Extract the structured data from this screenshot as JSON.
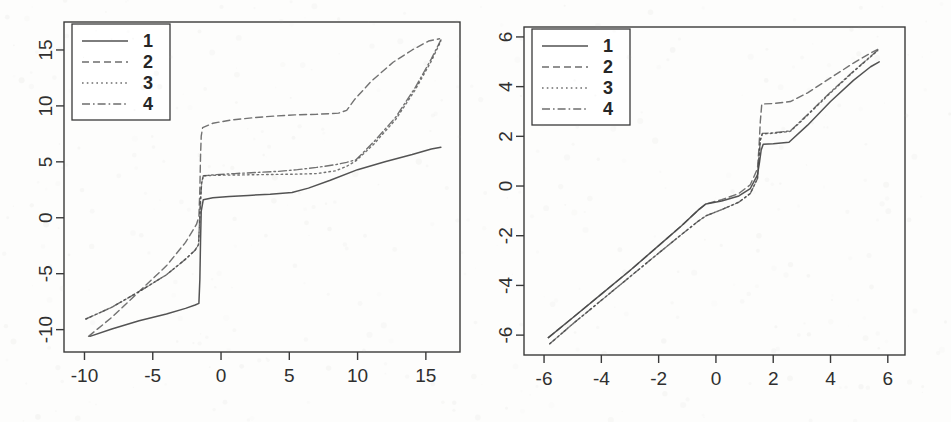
{
  "figure": {
    "title": "",
    "background_color": "#fdfdfc",
    "line_color": "#4a4a4a",
    "axis_color": "#3a3a3a",
    "panel_count": 2
  },
  "chart_data": [
    {
      "type": "line",
      "panel": "left",
      "title": "",
      "xlabel": "",
      "ylabel": "",
      "xlim": [
        -11.5,
        17.5
      ],
      "ylim": [
        -12.0,
        17.5
      ],
      "xticks": [
        -10,
        -5,
        0,
        5,
        10,
        15
      ],
      "yticks": [
        -10,
        -5,
        0,
        5,
        10,
        15
      ],
      "xtick_labels": [
        "-10",
        "-5",
        "0",
        "5",
        "10",
        "15"
      ],
      "ytick_labels": [
        "-10",
        "-5",
        "0",
        "5",
        "10",
        "15"
      ],
      "grid": false,
      "legend_position": "top-left",
      "legend_entries": [
        "1",
        "2",
        "3",
        "4"
      ],
      "series": [
        {
          "name": "1",
          "style": "solid",
          "x": [
            -9.6,
            -8.0,
            -6.0,
            -4.0,
            -2.6,
            -1.9,
            -1.62,
            -1.55,
            -1.5,
            -1.45,
            -1.3,
            -0.6,
            0.6,
            2.0,
            3.6,
            5.2,
            6.4,
            8.0,
            10.0,
            12.0,
            14.0,
            15.4,
            16.1
          ],
          "y": [
            -10.6,
            -9.95,
            -9.2,
            -8.6,
            -8.1,
            -7.8,
            -7.65,
            -5.5,
            -2.0,
            0.6,
            1.62,
            1.78,
            1.9,
            2.0,
            2.1,
            2.25,
            2.65,
            3.35,
            4.3,
            5.0,
            5.65,
            6.15,
            6.3
          ]
        },
        {
          "name": "2",
          "style": "dashed",
          "x": [
            -9.7,
            -8.0,
            -6.0,
            -4.0,
            -2.6,
            -1.8,
            -1.62,
            -1.55,
            -1.5,
            -1.45,
            -1.35,
            -0.6,
            0.8,
            2.4,
            4.0,
            5.4,
            7.0,
            8.6,
            9.2,
            9.8,
            11.0,
            12.6,
            14.0,
            15.2,
            16.0
          ],
          "y": [
            -10.6,
            -8.9,
            -6.6,
            -4.3,
            -2.2,
            -0.6,
            0.1,
            2.6,
            5.6,
            7.3,
            8.05,
            8.45,
            8.75,
            8.95,
            9.1,
            9.2,
            9.25,
            9.35,
            9.6,
            10.6,
            12.2,
            13.9,
            15.0,
            15.8,
            16.0
          ]
        },
        {
          "name": "3",
          "style": "dotted",
          "x": [
            -9.9,
            -8.0,
            -6.0,
            -4.0,
            -2.6,
            -1.9,
            -1.65,
            -1.58,
            -1.5,
            -1.42,
            -1.3,
            -0.4,
            1.0,
            2.6,
            4.2,
            5.6,
            7.0,
            8.4,
            9.2,
            9.9,
            11.2,
            12.8,
            14.2,
            15.4,
            16.1
          ],
          "y": [
            -9.05,
            -8.0,
            -6.6,
            -5.1,
            -3.7,
            -2.9,
            -2.4,
            -0.6,
            1.6,
            3.1,
            3.75,
            3.8,
            3.82,
            3.85,
            3.88,
            3.9,
            3.95,
            4.2,
            4.6,
            5.1,
            6.6,
            8.8,
            11.4,
            14.0,
            15.8
          ]
        },
        {
          "name": "4",
          "style": "dashdot",
          "x": [
            -9.9,
            -8.0,
            -6.0,
            -4.0,
            -2.6,
            -1.9,
            -1.65,
            -1.58,
            -1.5,
            -1.42,
            -1.3,
            -0.4,
            1.0,
            2.6,
            4.2,
            5.6,
            7.0,
            8.4,
            9.2,
            9.9,
            11.2,
            12.8,
            14.2,
            15.4,
            16.1
          ],
          "y": [
            -9.05,
            -8.0,
            -6.6,
            -5.1,
            -3.7,
            -2.9,
            -2.4,
            -0.6,
            1.6,
            3.1,
            3.75,
            3.85,
            3.95,
            4.05,
            4.15,
            4.3,
            4.5,
            4.75,
            4.95,
            5.2,
            6.8,
            9.0,
            11.6,
            14.2,
            15.9
          ]
        }
      ]
    },
    {
      "type": "line",
      "panel": "right",
      "title": "",
      "xlabel": "",
      "ylabel": "",
      "xlim": [
        -6.7,
        6.6
      ],
      "ylim": [
        -6.8,
        6.4
      ],
      "xticks": [
        -6,
        -4,
        -2,
        0,
        2,
        4,
        6
      ],
      "yticks": [
        -6,
        -4,
        -2,
        0,
        2,
        4,
        6
      ],
      "xtick_labels": [
        "-6",
        "-4",
        "-2",
        "0",
        "2",
        "4",
        "6"
      ],
      "ytick_labels": [
        "-6",
        "-4",
        "-2",
        "0",
        "2",
        "4",
        "6"
      ],
      "grid": false,
      "legend_position": "top-left",
      "legend_entries": [
        "1",
        "2",
        "3",
        "4"
      ],
      "series": [
        {
          "name": "1",
          "style": "solid",
          "x": [
            -5.85,
            -5.0,
            -4.0,
            -3.0,
            -2.0,
            -1.2,
            -0.6,
            -0.35,
            0.2,
            0.8,
            1.2,
            1.45,
            1.52,
            1.58,
            1.65,
            2.0,
            2.55,
            3.2,
            4.0,
            4.8,
            5.4,
            5.7
          ],
          "y": [
            -6.1,
            -5.3,
            -4.35,
            -3.4,
            -2.4,
            -1.6,
            -0.95,
            -0.72,
            -0.6,
            -0.4,
            -0.1,
            0.45,
            0.95,
            1.45,
            1.68,
            1.7,
            1.76,
            2.45,
            3.4,
            4.25,
            4.8,
            5.0
          ]
        },
        {
          "name": "2",
          "style": "dashed",
          "x": [
            -5.85,
            -5.0,
            -4.0,
            -3.0,
            -2.0,
            -1.2,
            -0.6,
            -0.35,
            0.2,
            0.8,
            1.2,
            1.45,
            1.5,
            1.55,
            1.6,
            2.0,
            2.6,
            3.2,
            4.0,
            4.8,
            5.4,
            5.65
          ],
          "y": [
            -6.1,
            -5.3,
            -4.35,
            -3.4,
            -2.4,
            -1.6,
            -0.95,
            -0.72,
            -0.55,
            -0.3,
            0.05,
            0.7,
            1.5,
            2.6,
            3.3,
            3.32,
            3.4,
            3.75,
            4.35,
            4.95,
            5.35,
            5.5
          ]
        },
        {
          "name": "3",
          "style": "dotted",
          "x": [
            -5.8,
            -5.0,
            -4.0,
            -3.0,
            -2.0,
            -1.2,
            -0.6,
            -0.35,
            0.2,
            0.8,
            1.2,
            1.45,
            1.5,
            1.55,
            1.62,
            2.0,
            2.6,
            3.2,
            4.0,
            4.8,
            5.4,
            5.65
          ],
          "y": [
            -6.35,
            -5.55,
            -4.6,
            -3.65,
            -2.7,
            -1.95,
            -1.4,
            -1.2,
            -0.95,
            -0.65,
            -0.3,
            0.3,
            1.1,
            1.85,
            2.1,
            2.12,
            2.2,
            2.85,
            3.75,
            4.6,
            5.2,
            5.45
          ]
        },
        {
          "name": "4",
          "style": "dashdot",
          "x": [
            -5.8,
            -5.0,
            -4.0,
            -3.0,
            -2.0,
            -1.2,
            -0.6,
            -0.35,
            0.2,
            0.8,
            1.2,
            1.45,
            1.5,
            1.55,
            1.62,
            2.0,
            2.6,
            3.2,
            4.0,
            4.8,
            5.4,
            5.65
          ],
          "y": [
            -6.35,
            -5.55,
            -4.6,
            -3.65,
            -2.7,
            -1.95,
            -1.4,
            -1.2,
            -0.95,
            -0.65,
            -0.3,
            0.3,
            1.1,
            1.85,
            2.12,
            2.14,
            2.22,
            2.88,
            3.78,
            4.62,
            5.22,
            5.47
          ]
        }
      ]
    }
  ]
}
